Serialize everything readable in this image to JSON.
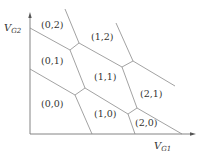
{
  "axes": {
    "x_label": "V",
    "x_sub": "G1",
    "y_label": "V",
    "y_sub": "G2"
  },
  "regions": [
    {
      "label": "(0,2)",
      "x": 42,
      "y": 28
    },
    {
      "label": "(0,1)",
      "x": 42,
      "y": 64
    },
    {
      "label": "(1,2)",
      "x": 92,
      "y": 40
    },
    {
      "label": "(1,1)",
      "x": 95,
      "y": 80
    },
    {
      "label": "(0,0)",
      "x": 42,
      "y": 107
    },
    {
      "label": "(1,0)",
      "x": 96,
      "y": 114
    },
    {
      "label": "(2,1)",
      "x": 141,
      "y": 96
    },
    {
      "label": "(2,0)",
      "x": 136,
      "y": 124
    }
  ],
  "colors": {
    "line": "#8a8a8a",
    "axis": "#777777",
    "text": "#333333"
  }
}
